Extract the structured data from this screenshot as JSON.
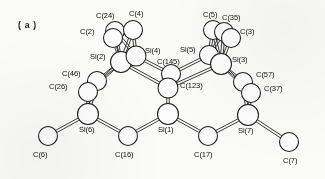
{
  "figure": {
    "panel_label": "( a )",
    "caption_type": "molecular-structure-ortep",
    "background_color": "#fbfbfa",
    "line_color": "#1a1a1a",
    "atom_fill_color": "#fdfdfd"
  },
  "chart_data": {
    "type": "diagram",
    "title": "( a )",
    "atoms": [
      {
        "id": "C24",
        "label": "C(24)",
        "element": "C",
        "cx": 115,
        "cy": 31,
        "r": 9.5,
        "label_x": 96,
        "label_y": 18,
        "label_anchor": "start"
      },
      {
        "id": "C4",
        "label": "C(4)",
        "element": "C",
        "cx": 133,
        "cy": 30,
        "r": 9.5,
        "label_x": 129,
        "label_y": 16,
        "label_anchor": "start"
      },
      {
        "id": "C2",
        "label": "C(2)",
        "element": "C",
        "cx": 113,
        "cy": 38,
        "r": 9.5,
        "label_x": 80,
        "label_y": 34,
        "label_anchor": "start"
      },
      {
        "id": "Si2",
        "label": "Si(2)",
        "element": "Si",
        "cx": 121,
        "cy": 62,
        "r": 10.5,
        "label_x": 90,
        "label_y": 59,
        "label_anchor": "start"
      },
      {
        "id": "Si4",
        "label": "Si(4)",
        "element": "Si",
        "cx": 136,
        "cy": 56,
        "r": 10.0,
        "label_x": 145,
        "label_y": 53,
        "label_anchor": "start"
      },
      {
        "id": "C5",
        "label": "C(5)",
        "element": "C",
        "cx": 213,
        "cy": 30,
        "r": 9.5,
        "label_x": 203,
        "label_y": 17,
        "label_anchor": "start"
      },
      {
        "id": "C35",
        "label": "C(35)",
        "element": "C",
        "cx": 224,
        "cy": 32,
        "r": 9.5,
        "label_x": 222,
        "label_y": 20,
        "label_anchor": "start"
      },
      {
        "id": "C3",
        "label": "C(3)",
        "element": "C",
        "cx": 231,
        "cy": 38,
        "r": 9.5,
        "label_x": 240,
        "label_y": 34,
        "label_anchor": "start"
      },
      {
        "id": "Si5",
        "label": "Si(5)",
        "element": "Si",
        "cx": 209,
        "cy": 55,
        "r": 9.5,
        "label_x": 180,
        "label_y": 52,
        "label_anchor": "start"
      },
      {
        "id": "Si3",
        "label": "Si(3)",
        "element": "Si",
        "cx": 221,
        "cy": 64,
        "r": 10.5,
        "label_x": 232,
        "label_y": 62,
        "label_anchor": "start"
      },
      {
        "id": "C145",
        "label": "C(145)",
        "element": "C",
        "cx": 171,
        "cy": 74,
        "r": 9.5,
        "label_x": 157,
        "label_y": 64,
        "label_anchor": "start"
      },
      {
        "id": "C123",
        "label": "C(123)",
        "element": "C",
        "cx": 168,
        "cy": 88,
        "r": 10.0,
        "label_x": 180,
        "label_y": 88,
        "label_anchor": "start"
      },
      {
        "id": "C46",
        "label": "C(46)",
        "element": "C",
        "cx": 97,
        "cy": 81,
        "r": 9.5,
        "label_x": 62,
        "label_y": 76,
        "label_anchor": "start"
      },
      {
        "id": "C26",
        "label": "C(26)",
        "element": "C",
        "cx": 88,
        "cy": 92,
        "r": 9.5,
        "label_x": 49,
        "label_y": 89,
        "label_anchor": "start"
      },
      {
        "id": "Si6",
        "label": "Si(6)",
        "element": "Si",
        "cx": 88,
        "cy": 114,
        "r": 10.5,
        "label_x": 79,
        "label_y": 132,
        "label_anchor": "start"
      },
      {
        "id": "C57",
        "label": "C(57)",
        "element": "C",
        "cx": 243,
        "cy": 82,
        "r": 9.5,
        "label_x": 256,
        "label_y": 77,
        "label_anchor": "start"
      },
      {
        "id": "C37",
        "label": "C(37)",
        "element": "C",
        "cx": 251,
        "cy": 93,
        "r": 9.5,
        "label_x": 264,
        "label_y": 91,
        "label_anchor": "start"
      },
      {
        "id": "Si7",
        "label": "Si(7)",
        "element": "Si",
        "cx": 248,
        "cy": 115,
        "r": 10.5,
        "label_x": 238,
        "label_y": 133,
        "label_anchor": "start"
      },
      {
        "id": "Si1",
        "label": "Si(1)",
        "element": "Si",
        "cx": 168,
        "cy": 114,
        "r": 10.5,
        "label_x": 158,
        "label_y": 132,
        "label_anchor": "start"
      },
      {
        "id": "C16",
        "label": "C(16)",
        "element": "C",
        "cx": 128,
        "cy": 136,
        "r": 9.5,
        "label_x": 115,
        "label_y": 157,
        "label_anchor": "start"
      },
      {
        "id": "C17",
        "label": "C(17)",
        "element": "C",
        "cx": 208,
        "cy": 136,
        "r": 9.5,
        "label_x": 194,
        "label_y": 157,
        "label_anchor": "start"
      },
      {
        "id": "C6",
        "label": "C(6)",
        "element": "C",
        "cx": 48,
        "cy": 136,
        "r": 9.5,
        "label_x": 33,
        "label_y": 157,
        "label_anchor": "start"
      },
      {
        "id": "C7",
        "label": "C(7)",
        "element": "C",
        "cx": 289,
        "cy": 142,
        "r": 9.5,
        "label_x": 283,
        "label_y": 163,
        "label_anchor": "start"
      }
    ],
    "bonds": [
      {
        "from": "Si2",
        "to": "C2",
        "style": "double"
      },
      {
        "from": "Si2",
        "to": "C24",
        "style": "double"
      },
      {
        "from": "Si2",
        "to": "C4",
        "style": "double"
      },
      {
        "from": "Si4",
        "to": "C24",
        "style": "double"
      },
      {
        "from": "Si4",
        "to": "C4",
        "style": "double"
      },
      {
        "from": "Si2",
        "to": "C46",
        "style": "double"
      },
      {
        "from": "Si2",
        "to": "C26",
        "style": "double"
      },
      {
        "from": "Si4",
        "to": "C145",
        "style": "double"
      },
      {
        "from": "Si2",
        "to": "C123",
        "style": "double"
      },
      {
        "from": "C46",
        "to": "Si6",
        "style": "double"
      },
      {
        "from": "C26",
        "to": "Si6",
        "style": "double"
      },
      {
        "from": "Si6",
        "to": "C6",
        "style": "double"
      },
      {
        "from": "Si6",
        "to": "C16",
        "style": "double"
      },
      {
        "from": "C16",
        "to": "Si1",
        "style": "double"
      },
      {
        "from": "Si1",
        "to": "C123",
        "style": "double"
      },
      {
        "from": "C123",
        "to": "C145",
        "style": "double"
      },
      {
        "from": "C145",
        "to": "Si5",
        "style": "double"
      },
      {
        "from": "C123",
        "to": "Si3",
        "style": "double"
      },
      {
        "from": "Si5",
        "to": "C5",
        "style": "double"
      },
      {
        "from": "Si5",
        "to": "C35",
        "style": "double"
      },
      {
        "from": "Si3",
        "to": "C5",
        "style": "double"
      },
      {
        "from": "Si3",
        "to": "C35",
        "style": "double"
      },
      {
        "from": "Si3",
        "to": "C3",
        "style": "double"
      },
      {
        "from": "Si3",
        "to": "C57",
        "style": "double"
      },
      {
        "from": "Si3",
        "to": "C37",
        "style": "double"
      },
      {
        "from": "C57",
        "to": "Si7",
        "style": "double"
      },
      {
        "from": "C37",
        "to": "Si7",
        "style": "double"
      },
      {
        "from": "Si1",
        "to": "C17",
        "style": "double"
      },
      {
        "from": "C17",
        "to": "Si7",
        "style": "double"
      },
      {
        "from": "Si7",
        "to": "C7",
        "style": "double"
      }
    ]
  }
}
